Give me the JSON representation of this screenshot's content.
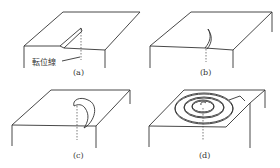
{
  "figure": {
    "panels": [
      {
        "id": "a",
        "label": "(a)",
        "annotation": "転位線"
      },
      {
        "id": "b",
        "label": "(b)"
      },
      {
        "id": "c",
        "label": "(c)"
      },
      {
        "id": "d",
        "label": "(d)"
      }
    ]
  }
}
